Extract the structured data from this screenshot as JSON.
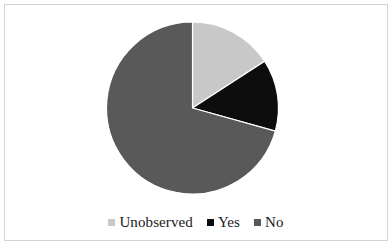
{
  "chart_data": {
    "type": "pie",
    "title": "",
    "subtitle": "",
    "xlabel": "",
    "ylabel": "",
    "grid": false,
    "legend_position": "bottom",
    "start_angle_deg": 0,
    "direction": "clockwise",
    "categories": [
      "Unobserved",
      "Yes",
      "No"
    ],
    "values": [
      15.8,
      13.5,
      70.7
    ],
    "units": "percent",
    "colors": [
      "#c8c8c8",
      "#0d0d0d",
      "#595959"
    ],
    "slices": [
      {
        "label": "Unobserved",
        "value": 15.8,
        "color": "#c8c8c8",
        "start_angle_deg": 0,
        "end_angle_deg": 57
      },
      {
        "label": "Yes",
        "value": 13.5,
        "color": "#0d0d0d",
        "start_angle_deg": 57,
        "end_angle_deg": 105.6
      },
      {
        "label": "No",
        "value": 70.7,
        "color": "#595959",
        "start_angle_deg": 105.6,
        "end_angle_deg": 360
      }
    ]
  },
  "figure": {
    "background_color": "#ffffff",
    "border_color": "#d4d4d4",
    "center_x": 192.5,
    "center_y": 108,
    "radius": 86
  },
  "legend": {
    "entries": [
      {
        "label": "Unobserved",
        "swatch_name": "legend-swatch-unobserved",
        "color": "#c8c8c8"
      },
      {
        "label": "Yes",
        "swatch_name": "legend-swatch-yes",
        "color": "#0d0d0d"
      },
      {
        "label": "No",
        "swatch_name": "legend-swatch-no",
        "color": "#595959"
      }
    ]
  }
}
